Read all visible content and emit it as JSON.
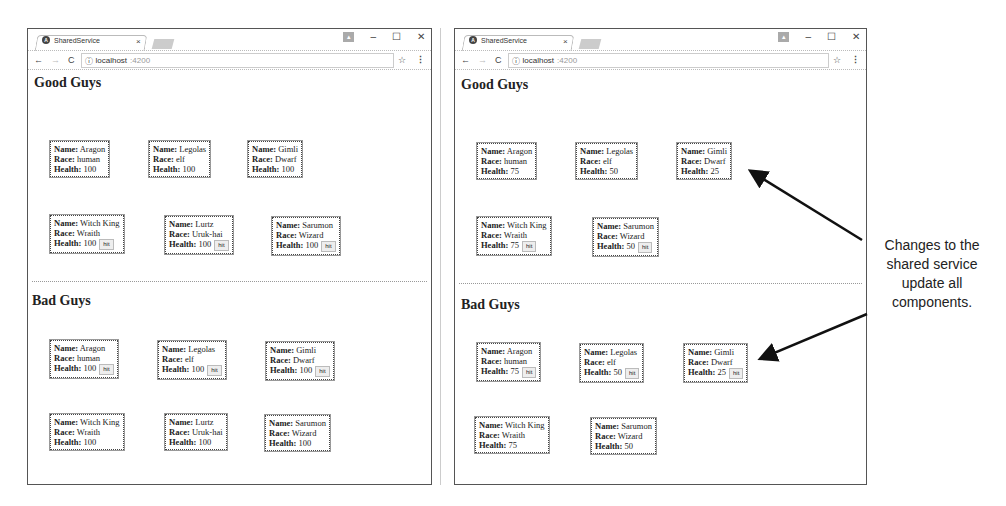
{
  "windows": [
    {
      "id": "left",
      "tab_title": "SharedService",
      "tab_close": "×",
      "url_host": "localhost",
      "url_port": ":4200",
      "info_icon": "ⓘ",
      "controls": {
        "minimize": "–",
        "maximize": "☐",
        "close": "✕"
      },
      "good_guys": {
        "heading": "Good Guys",
        "cards": [
          {
            "name": "Aragon",
            "race": "human",
            "health": "100",
            "hit": false
          },
          {
            "name": "Legolas",
            "race": "elf",
            "health": "100",
            "hit": false
          },
          {
            "name": "Gimli",
            "race": "Dwarf",
            "health": "100",
            "hit": false
          },
          {
            "name": "Witch King",
            "race": "Wraith",
            "health": "100",
            "hit": true
          },
          {
            "name": "Lurtz",
            "race": "Uruk-hai",
            "health": "100",
            "hit": true
          },
          {
            "name": "Sarumon",
            "race": "Wizard",
            "health": "100",
            "hit": true
          }
        ]
      },
      "bad_guys": {
        "heading": "Bad Guys",
        "cards": [
          {
            "name": "Aragon",
            "race": "human",
            "health": "100",
            "hit": true
          },
          {
            "name": "Legolas",
            "race": "elf",
            "health": "100",
            "hit": true
          },
          {
            "name": "Gimli",
            "race": "Dwarf",
            "health": "100",
            "hit": true
          },
          {
            "name": "Witch King",
            "race": "Wraith",
            "health": "100",
            "hit": false
          },
          {
            "name": "Lurtz",
            "race": "Uruk-hai",
            "health": "100",
            "hit": false
          },
          {
            "name": "Sarumon",
            "race": "Wizard",
            "health": "100",
            "hit": false
          }
        ]
      }
    },
    {
      "id": "right",
      "tab_title": "SharedService",
      "tab_close": "×",
      "url_host": "localhost",
      "url_port": ":4200",
      "info_icon": "ⓘ",
      "controls": {
        "minimize": "–",
        "maximize": "☐",
        "close": "✕"
      },
      "good_guys": {
        "heading": "Good Guys",
        "cards": [
          {
            "name": "Aragon",
            "race": "human",
            "health": "75",
            "hit": false
          },
          {
            "name": "Legolas",
            "race": "elf",
            "health": "50",
            "hit": false
          },
          {
            "name": "Gimli",
            "race": "Dwarf",
            "health": "25",
            "hit": false
          },
          {
            "name": "Witch King",
            "race": "Wraith",
            "health": "75",
            "hit": true
          },
          {
            "name": "Sarumon",
            "race": "Wizard",
            "health": "50",
            "hit": true
          }
        ]
      },
      "bad_guys": {
        "heading": "Bad Guys",
        "cards": [
          {
            "name": "Aragon",
            "race": "human",
            "health": "75",
            "hit": true
          },
          {
            "name": "Legolas",
            "race": "elf",
            "health": "50",
            "hit": true
          },
          {
            "name": "Gimli",
            "race": "Dwarf",
            "health": "25",
            "hit": true
          },
          {
            "name": "Witch King",
            "race": "Wraith",
            "health": "75",
            "hit": false
          },
          {
            "name": "Sarumon",
            "race": "Wizard",
            "health": "50",
            "hit": false
          }
        ]
      }
    }
  ],
  "labels": {
    "name": "Name:",
    "race": "Race:",
    "health": "Health:",
    "hit_button": "hit"
  },
  "annotation": {
    "text_lines": [
      "Changes to the",
      "shared service",
      "update all",
      "components."
    ]
  }
}
